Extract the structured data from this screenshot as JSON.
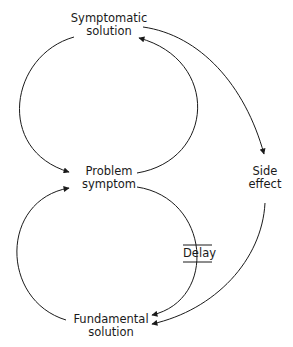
{
  "diagram": {
    "type": "causal-loop",
    "nodes": {
      "symptomatic_solution": {
        "line1": "Symptomatic",
        "line2": "solution"
      },
      "problem_symptom": {
        "line1": "Problem",
        "line2": "symptom"
      },
      "side_effect": {
        "line1": "Side",
        "line2": "effect"
      },
      "fundamental_solution": {
        "line1": "Fundamental",
        "line2": "solution"
      }
    },
    "delay_label": "Delay",
    "edges": [
      {
        "from": "symptomatic_solution",
        "to": "problem_symptom"
      },
      {
        "from": "problem_symptom",
        "to": "symptomatic_solution"
      },
      {
        "from": "symptomatic_solution",
        "to": "side_effect"
      },
      {
        "from": "side_effect",
        "to": "fundamental_solution"
      },
      {
        "from": "problem_symptom",
        "to": "fundamental_solution",
        "delay": true
      },
      {
        "from": "fundamental_solution",
        "to": "problem_symptom"
      }
    ],
    "colors": {
      "line": "#1a1a1a",
      "text": "#1a1a1a",
      "background": "#ffffff"
    }
  }
}
